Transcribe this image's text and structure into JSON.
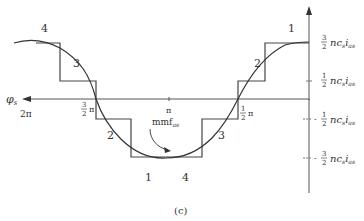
{
  "figure": {
    "caption": "(c)",
    "x_axis": {
      "label": "φs",
      "label_sub": "s",
      "ticks": [
        {
          "label": "2π",
          "pos": "2pi"
        },
        {
          "label": "3/2 π",
          "pos": "3pi/2"
        },
        {
          "label": "π",
          "pos": "pi"
        },
        {
          "label": "1/2 π",
          "pos": "pi/2"
        }
      ]
    },
    "y_axis": {
      "ticks": [
        {
          "sign": "",
          "num": "3",
          "den": "2",
          "text": "nc",
          "sub1": "s",
          "var": "i",
          "sub2": "as"
        },
        {
          "sign": "",
          "num": "1",
          "den": "2",
          "text": "nc",
          "sub1": "s",
          "var": "i",
          "sub2": "as"
        },
        {
          "sign": "-",
          "num": "1",
          "den": "2",
          "text": "nc",
          "sub1": "s",
          "var": "i",
          "sub2": "as"
        },
        {
          "sign": "-",
          "num": "3",
          "den": "2",
          "text": "nc",
          "sub1": "s",
          "var": "i",
          "sub2": "as"
        }
      ]
    },
    "step_labels": {
      "top_left": "4",
      "left_upper": "3",
      "left_lower": "2",
      "bottom_left": "1",
      "bottom_right": "4",
      "right_lower": "3",
      "right_upper": "2",
      "top_right": "1"
    },
    "curve_label": {
      "main": "mmf",
      "sub": "as"
    },
    "colors": {
      "line": "#333333",
      "background": "#ffffff"
    }
  }
}
